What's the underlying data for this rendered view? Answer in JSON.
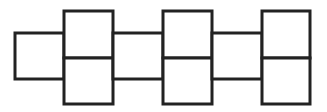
{
  "diagram": {
    "stroke_color": "#222222",
    "fill_color": "#ffffff",
    "shapes": [
      {
        "name": "single-square-1",
        "x": 15,
        "y": 33,
        "w": 49,
        "h": 46
      },
      {
        "name": "pair-1-top",
        "x": 64,
        "y": 11,
        "w": 49,
        "h": 47
      },
      {
        "name": "pair-1-bottom",
        "x": 64,
        "y": 58,
        "w": 49,
        "h": 46
      },
      {
        "name": "single-square-2",
        "x": 113,
        "y": 33,
        "w": 50,
        "h": 46
      },
      {
        "name": "pair-2-top",
        "x": 163,
        "y": 11,
        "w": 49,
        "h": 47
      },
      {
        "name": "pair-2-bottom",
        "x": 163,
        "y": 58,
        "w": 49,
        "h": 46
      },
      {
        "name": "single-square-3",
        "x": 212,
        "y": 33,
        "w": 50,
        "h": 46
      },
      {
        "name": "pair-3-top",
        "x": 262,
        "y": 11,
        "w": 48,
        "h": 47
      },
      {
        "name": "pair-3-bottom",
        "x": 262,
        "y": 58,
        "w": 48,
        "h": 46
      }
    ]
  }
}
